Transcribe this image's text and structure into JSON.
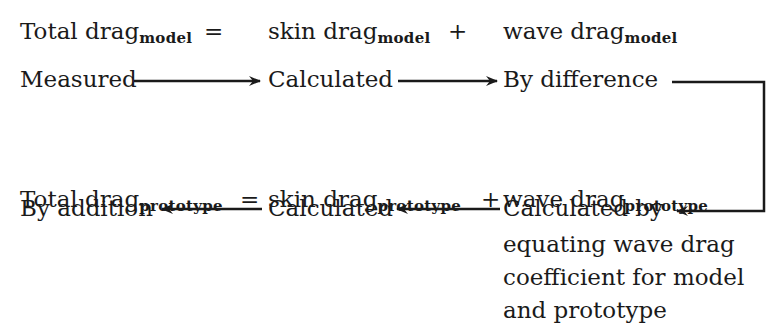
{
  "equation_model": {
    "total": "Total drag",
    "total_sub": "model",
    "eq": "=",
    "skin": "skin drag",
    "skin_sub": "model",
    "plus": "+",
    "wave": "wave drag",
    "wave_sub": "model"
  },
  "flow_model": {
    "measured": "Measured",
    "calculated": "Calculated",
    "by_difference": "By difference"
  },
  "equation_prototype": {
    "total": "Total drag",
    "total_sub": "prototype",
    "eq": "=",
    "skin": "skin drag",
    "skin_sub": "prototype",
    "plus": "+",
    "wave": "wave drag",
    "wave_sub": "prototype"
  },
  "flow_prototype": {
    "by_addition": "By addition",
    "calculated": "Calculated",
    "calculated_by_lines": [
      "Calculated by",
      "equating wave drag",
      "coefficient for model",
      "and prototype"
    ]
  }
}
